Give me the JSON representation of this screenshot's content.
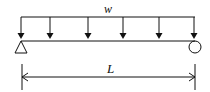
{
  "diagram": {
    "load_label": "w",
    "length_label": "L",
    "load_arrow_count": 6,
    "supports": {
      "left": "pin",
      "right": "roller"
    },
    "colors": {
      "stroke": "#111111",
      "background": "#ffffff"
    }
  }
}
